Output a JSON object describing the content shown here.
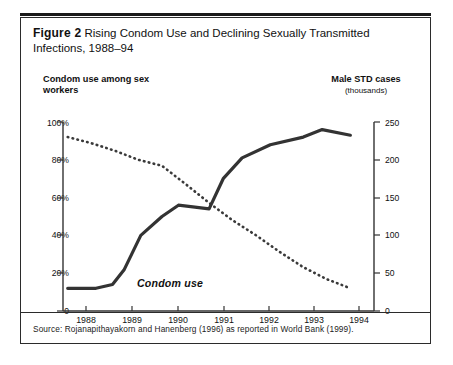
{
  "figure": {
    "label": "Figure 2",
    "title": "Rising Condom Use and Declining Sexually Transmitted Infections, 1988–94",
    "source": "Source: Rojanapithayakorn and Hanenberg (1996) as reported in World Bank (1999)."
  },
  "axes": {
    "left_title": "Condom use among sex workers",
    "right_title": "Male STD cases",
    "right_subtitle": "(thousands)",
    "left_ticks": [
      "100%",
      "80%",
      "60%",
      "40%",
      "20%",
      "0"
    ],
    "right_ticks": [
      "250",
      "200",
      "150",
      "100",
      "50",
      "0"
    ],
    "x_ticks": [
      "1988",
      "1989",
      "1990",
      "1991",
      "1992",
      "1993",
      "1994"
    ]
  },
  "annotations": {
    "condom_use": "Condom use"
  },
  "chart_data": {
    "type": "line",
    "title": "Rising Condom Use and Declining Sexually Transmitted Infections, 1988–94",
    "xlabel": "",
    "ylabel": "Condom use among sex workers",
    "y2label": "Male STD cases (thousands)",
    "grid": false,
    "legend": "inline-annotation",
    "xlim": [
      1987.8,
      1994.4
    ],
    "ylim": [
      0,
      100
    ],
    "y2lim": [
      0,
      250
    ],
    "x_tick_values": [
      1988,
      1989,
      1990,
      1991,
      1992,
      1993,
      1994
    ],
    "series": [
      {
        "name": "Condom use",
        "axis": "left",
        "style": "solid",
        "color": "#333333",
        "units": "percent",
        "x": [
          1987.9,
          1988.5,
          1988.85,
          1989.1,
          1989.45,
          1989.9,
          1990.25,
          1990.6,
          1990.9,
          1991.2,
          1991.6,
          1992.2,
          1992.9,
          1993.3,
          1993.9
        ],
        "values": [
          12,
          12,
          14,
          22,
          40,
          50,
          56,
          55,
          54,
          70,
          81,
          88,
          92,
          96,
          93
        ]
      },
      {
        "name": "Male STD cases",
        "axis": "right",
        "style": "dotted",
        "color": "#3a3a3a",
        "units": "thousands",
        "x": [
          1987.9,
          1988.4,
          1988.9,
          1989.4,
          1989.9,
          1990.4,
          1990.9,
          1991.4,
          1991.9,
          1992.4,
          1992.9,
          1993.4,
          1993.9
        ],
        "values": [
          230,
          222,
          212,
          200,
          192,
          168,
          143,
          120,
          100,
          78,
          58,
          42,
          30
        ]
      }
    ]
  }
}
